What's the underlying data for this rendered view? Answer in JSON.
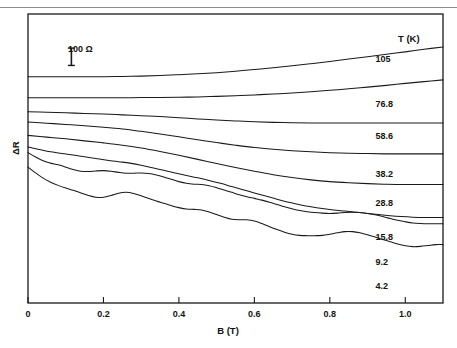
{
  "figure": {
    "kind": "magnetoresistance-trace-stack",
    "scalebar": {
      "label": "100 Ω",
      "value": 100,
      "unit": "Ω"
    },
    "series_header": {
      "symbol": "T",
      "unit": "(K)",
      "text": "T (K)"
    },
    "axis_frame": {
      "left": 28,
      "top": 14,
      "right": 443,
      "bottom": 303
    }
  },
  "chart_data": {
    "type": "line",
    "title": "",
    "subtitle": "",
    "xlabel": "B (T)",
    "ylabel": "ΔR",
    "xlim": [
      0,
      1.1
    ],
    "ylim": [
      0,
      1
    ],
    "grid": false,
    "legend_position": "right-inline",
    "x_ticks": [
      0,
      0.2,
      0.4,
      0.6,
      0.8,
      1.0
    ],
    "x_tick_labels": [
      "0",
      "0.2",
      "0.4",
      "0.6",
      "0.8",
      "1.0"
    ],
    "y_ticks": [],
    "y_tick_labels": [],
    "annotations": [
      {
        "name": "scale-bar",
        "text": "100 Ω",
        "x": 0.115,
        "y_top": 0.882,
        "y_bottom": 0.822
      },
      {
        "name": "series-column-header",
        "text": "T (K)"
      }
    ],
    "series": [
      {
        "name": "105",
        "label": "105",
        "temperature_K": 105,
        "label_x": 0.985,
        "label_y": 0.845,
        "x": [
          0.0,
          0.05,
          0.1,
          0.15,
          0.2,
          0.25,
          0.3,
          0.35,
          0.4,
          0.45,
          0.5,
          0.55,
          0.6,
          0.65,
          0.7,
          0.75,
          0.8,
          0.85,
          0.9,
          0.95,
          1.0,
          1.05,
          1.1
        ],
        "y": [
          0.783,
          0.783,
          0.783,
          0.783,
          0.783,
          0.784,
          0.785,
          0.787,
          0.79,
          0.793,
          0.797,
          0.802,
          0.808,
          0.814,
          0.821,
          0.828,
          0.836,
          0.844,
          0.852,
          0.861,
          0.869,
          0.878,
          0.886
        ]
      },
      {
        "name": "76.8",
        "label": "76.8",
        "temperature_K": 76.8,
        "label_x": 0.985,
        "label_y": 0.69,
        "x": [
          0.0,
          0.05,
          0.1,
          0.15,
          0.2,
          0.25,
          0.3,
          0.35,
          0.4,
          0.45,
          0.5,
          0.55,
          0.6,
          0.65,
          0.7,
          0.75,
          0.8,
          0.85,
          0.9,
          0.95,
          1.0,
          1.05,
          1.1
        ],
        "y": [
          0.71,
          0.71,
          0.71,
          0.71,
          0.71,
          0.71,
          0.711,
          0.711,
          0.712,
          0.713,
          0.715,
          0.717,
          0.72,
          0.723,
          0.727,
          0.731,
          0.736,
          0.741,
          0.747,
          0.753,
          0.76,
          0.766,
          0.772
        ]
      },
      {
        "name": "58.6",
        "label": "58.6",
        "temperature_K": 58.6,
        "label_x": 0.985,
        "label_y": 0.578,
        "x": [
          0.0,
          0.05,
          0.1,
          0.15,
          0.2,
          0.25,
          0.3,
          0.35,
          0.4,
          0.45,
          0.5,
          0.55,
          0.6,
          0.65,
          0.7,
          0.75,
          0.8,
          0.85,
          0.9,
          0.95,
          1.0,
          1.05,
          1.1
        ],
        "y": [
          0.662,
          0.66,
          0.658,
          0.656,
          0.654,
          0.651,
          0.648,
          0.645,
          0.641,
          0.637,
          0.633,
          0.63,
          0.627,
          0.625,
          0.624,
          0.623,
          0.623,
          0.623,
          0.623,
          0.623,
          0.623,
          0.623,
          0.623
        ]
      },
      {
        "name": "38.2",
        "label": "38.2",
        "temperature_K": 38.2,
        "label_x": 0.985,
        "label_y": 0.448,
        "x": [
          0.0,
          0.05,
          0.1,
          0.15,
          0.2,
          0.25,
          0.3,
          0.35,
          0.4,
          0.45,
          0.5,
          0.55,
          0.6,
          0.65,
          0.7,
          0.75,
          0.8,
          0.85,
          0.9,
          0.95,
          1.0,
          1.05,
          1.1
        ],
        "y": [
          0.626,
          0.622,
          0.618,
          0.613,
          0.608,
          0.602,
          0.594,
          0.585,
          0.575,
          0.565,
          0.555,
          0.546,
          0.538,
          0.532,
          0.527,
          0.523,
          0.52,
          0.518,
          0.517,
          0.516,
          0.516,
          0.516,
          0.516
        ]
      },
      {
        "name": "28.8",
        "label": "28.8",
        "temperature_K": 28.8,
        "label_x": 0.985,
        "label_y": 0.345,
        "x": [
          0.0,
          0.05,
          0.1,
          0.15,
          0.2,
          0.25,
          0.3,
          0.35,
          0.4,
          0.45,
          0.5,
          0.55,
          0.6,
          0.65,
          0.7,
          0.75,
          0.8,
          0.85,
          0.9,
          0.95,
          1.0,
          1.05,
          1.1
        ],
        "y": [
          0.58,
          0.574,
          0.568,
          0.561,
          0.554,
          0.546,
          0.536,
          0.524,
          0.511,
          0.497,
          0.483,
          0.469,
          0.456,
          0.444,
          0.434,
          0.426,
          0.42,
          0.416,
          0.413,
          0.411,
          0.41,
          0.41,
          0.41
        ]
      },
      {
        "name": "15.8",
        "label": "15.8",
        "temperature_K": 15.8,
        "label_x": 0.985,
        "label_y": 0.228,
        "x": [
          0.0,
          0.03,
          0.06,
          0.09,
          0.12,
          0.15,
          0.18,
          0.21,
          0.24,
          0.27,
          0.3,
          0.33,
          0.36,
          0.39,
          0.42,
          0.45,
          0.48,
          0.51,
          0.54,
          0.57,
          0.6,
          0.63,
          0.66,
          0.69,
          0.72,
          0.75,
          0.78,
          0.81,
          0.84,
          0.87,
          0.9,
          0.93,
          0.96,
          0.99,
          1.02,
          1.05,
          1.08,
          1.1
        ],
        "y": [
          0.54,
          0.531,
          0.523,
          0.517,
          0.512,
          0.506,
          0.5,
          0.494,
          0.489,
          0.484,
          0.477,
          0.468,
          0.459,
          0.45,
          0.441,
          0.433,
          0.424,
          0.414,
          0.403,
          0.392,
          0.381,
          0.37,
          0.359,
          0.349,
          0.34,
          0.333,
          0.327,
          0.322,
          0.318,
          0.314,
          0.31,
          0.306,
          0.302,
          0.299,
          0.297,
          0.296,
          0.296,
          0.296
        ]
      },
      {
        "name": "9.2",
        "label": "9.2",
        "temperature_K": 9.2,
        "label_x": 0.985,
        "label_y": 0.142,
        "x": [
          0.0,
          0.02,
          0.04,
          0.06,
          0.08,
          0.1,
          0.12,
          0.14,
          0.16,
          0.18,
          0.2,
          0.22,
          0.24,
          0.26,
          0.28,
          0.3,
          0.32,
          0.34,
          0.36,
          0.38,
          0.4,
          0.42,
          0.44,
          0.46,
          0.48,
          0.5,
          0.52,
          0.54,
          0.56,
          0.58,
          0.6,
          0.62,
          0.64,
          0.66,
          0.68,
          0.7,
          0.72,
          0.74,
          0.76,
          0.78,
          0.8,
          0.82,
          0.84,
          0.86,
          0.88,
          0.9,
          0.92,
          0.94,
          0.96,
          0.98,
          1.0,
          1.02,
          1.04,
          1.06,
          1.08,
          1.1
        ],
        "y": [
          0.52,
          0.505,
          0.492,
          0.484,
          0.478,
          0.47,
          0.462,
          0.456,
          0.455,
          0.457,
          0.458,
          0.456,
          0.452,
          0.449,
          0.449,
          0.45,
          0.448,
          0.443,
          0.436,
          0.428,
          0.42,
          0.414,
          0.411,
          0.41,
          0.406,
          0.399,
          0.391,
          0.383,
          0.375,
          0.368,
          0.362,
          0.356,
          0.349,
          0.341,
          0.333,
          0.326,
          0.32,
          0.316,
          0.313,
          0.311,
          0.31,
          0.311,
          0.313,
          0.314,
          0.313,
          0.31,
          0.305,
          0.299,
          0.292,
          0.286,
          0.281,
          0.277,
          0.275,
          0.274,
          0.274,
          0.274
        ]
      },
      {
        "name": "4.2",
        "label": "4.2",
        "temperature_K": 4.2,
        "label_x": 0.985,
        "label_y": 0.06,
        "x": [
          0.0,
          0.02,
          0.04,
          0.06,
          0.08,
          0.1,
          0.12,
          0.14,
          0.16,
          0.18,
          0.2,
          0.22,
          0.24,
          0.26,
          0.28,
          0.3,
          0.32,
          0.34,
          0.36,
          0.38,
          0.4,
          0.42,
          0.44,
          0.46,
          0.48,
          0.5,
          0.52,
          0.54,
          0.56,
          0.58,
          0.6,
          0.62,
          0.64,
          0.66,
          0.68,
          0.7,
          0.72,
          0.74,
          0.76,
          0.78,
          0.8,
          0.82,
          0.84,
          0.86,
          0.88,
          0.9,
          0.92,
          0.94,
          0.96,
          0.98,
          1.0,
          1.02,
          1.04,
          1.06,
          1.08,
          1.1
        ],
        "y": [
          0.47,
          0.45,
          0.432,
          0.418,
          0.407,
          0.398,
          0.39,
          0.381,
          0.372,
          0.366,
          0.366,
          0.372,
          0.38,
          0.383,
          0.379,
          0.371,
          0.362,
          0.353,
          0.345,
          0.337,
          0.33,
          0.325,
          0.324,
          0.322,
          0.315,
          0.306,
          0.297,
          0.29,
          0.288,
          0.288,
          0.284,
          0.275,
          0.264,
          0.254,
          0.245,
          0.238,
          0.234,
          0.233,
          0.233,
          0.234,
          0.238,
          0.243,
          0.247,
          0.247,
          0.243,
          0.236,
          0.228,
          0.22,
          0.212,
          0.204,
          0.198,
          0.195,
          0.196,
          0.199,
          0.202,
          0.202
        ]
      }
    ]
  },
  "style": {
    "line_color": "#1a1a1a",
    "frame_color": "#1a1a1a",
    "text_color": "#15120f",
    "background": "#ffffff",
    "rule_color": "#8d8d8d"
  }
}
